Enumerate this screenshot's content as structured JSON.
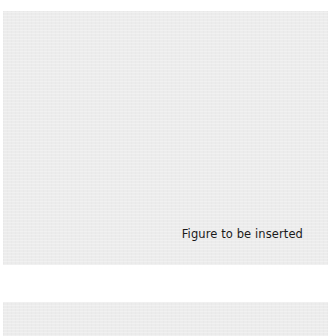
{
  "figure_placeholder": {
    "caption": "Figure to be inserted",
    "background_color": "#ececec"
  },
  "second_placeholder": {
    "background_color": "#ececec"
  }
}
